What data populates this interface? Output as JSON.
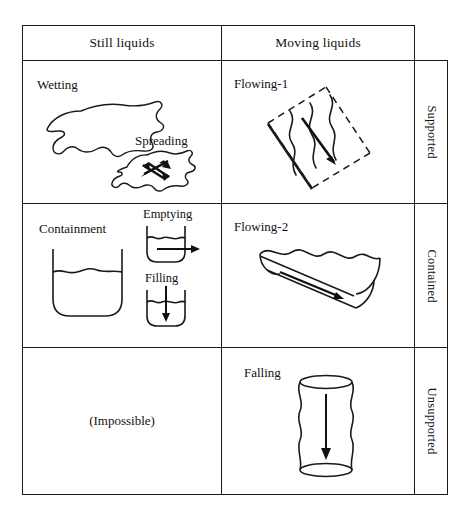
{
  "figure": {
    "type": "matrix-table",
    "title": "",
    "column_headers": [
      "Still liquids",
      "Moving liquids"
    ],
    "row_labels": [
      "Supported",
      "Contained",
      "Unsupported"
    ],
    "line_color": "#1a1a1a",
    "background": "#ffffff"
  },
  "cells": {
    "supported_still": {
      "primary_label": "Wetting",
      "secondary_label": "Spreading",
      "icons": [
        "liquid-blob-outline",
        "spreading-blob-with-four-way-arrow"
      ]
    },
    "supported_moving": {
      "primary_label": "Flowing-1",
      "icons": [
        "inclined-dashed-plane",
        "wavy-flow-lines",
        "down-slope-arrow"
      ]
    },
    "contained_still": {
      "primary_label": "Containment",
      "secondary_label": "Emptying",
      "tertiary_label": "Filling",
      "icons": [
        "large-vessel-with-liquid",
        "small-vessel-outflow-arrow",
        "small-vessel-inflow-arrow"
      ]
    },
    "contained_moving": {
      "primary_label": "Flowing-2",
      "icons": [
        "inclined-open-channel",
        "wavy-surface",
        "downstream-arrow"
      ]
    },
    "unsupported_still": {
      "primary_label": "(Impossible)",
      "icons": []
    },
    "unsupported_moving": {
      "primary_label": "Falling",
      "icons": [
        "falling-liquid-column",
        "down-arrow"
      ]
    }
  }
}
